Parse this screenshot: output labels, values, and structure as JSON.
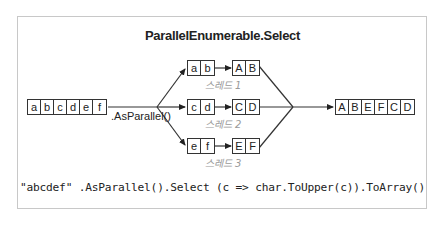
{
  "diagram": {
    "title": "ParallelEnumerable.Select",
    "input": [
      "a",
      "b",
      "c",
      "d",
      "e",
      "f"
    ],
    "operator_label": ".AsParallel()",
    "threads": [
      {
        "label": "스레드 1",
        "input": [
          "a",
          "b"
        ],
        "output": [
          "A",
          "B"
        ]
      },
      {
        "label": "스레드 2",
        "input": [
          "c",
          "d"
        ],
        "output": [
          "C",
          "D"
        ]
      },
      {
        "label": "스레드 3",
        "input": [
          "e",
          "f"
        ],
        "output": [
          "E",
          "F"
        ]
      }
    ],
    "output": [
      "A",
      "B",
      "E",
      "F",
      "C",
      "D"
    ],
    "code": "\"abcdef\" .AsParallel().Select (c => char.ToUpper(c)).ToArray()"
  }
}
